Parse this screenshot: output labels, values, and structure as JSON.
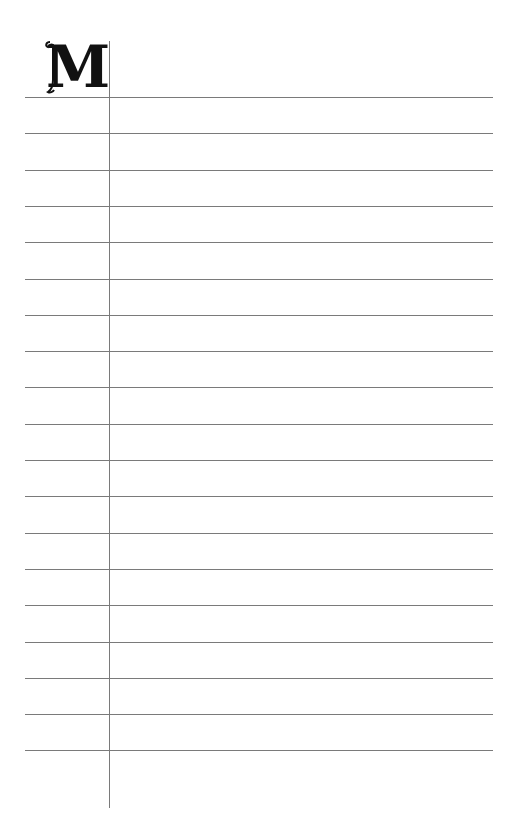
{
  "page": {
    "type": "lined-journal-page",
    "initial_letter": "M",
    "line_count": 19,
    "first_line_y": 97,
    "line_spacing": 36.3,
    "colors": {
      "background": "#ffffff",
      "rule": "#7a7a7a",
      "initial": "#111111"
    }
  }
}
